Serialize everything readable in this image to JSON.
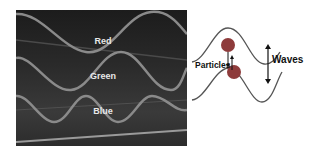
{
  "photo": {
    "waves": [
      {
        "label": "Red",
        "label_x": 102,
        "label_y": 35
      },
      {
        "label": "Green",
        "label_x": 102,
        "label_y": 70
      },
      {
        "label": "Blue",
        "label_x": 102,
        "label_y": 105
      }
    ],
    "colors": {
      "background": "#2a2a2a",
      "wave_stroke": "#8a8a8a",
      "label": "#e8e8e8"
    }
  },
  "diagram": {
    "particles_label": "Particles",
    "waves_label": "Waves",
    "colors": {
      "particle_fill": "#8e3b3b",
      "line": "#555555"
    }
  }
}
